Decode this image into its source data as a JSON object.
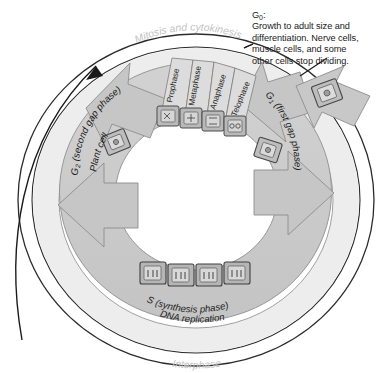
{
  "figure": {
    "type": "cell-cycle-diagram",
    "outer_band_label": "Interphase",
    "top_arc_label": "Mitosis and cytokinesis"
  },
  "callout": {
    "title_main": "G",
    "title_sub": "0",
    "title_colon": ":",
    "line1": "Growth to adult  size and",
    "line2": "differentiation. Nerve cells,",
    "line3": "muscle cells, and some",
    "line4": "other cells stop dividing."
  },
  "phases": {
    "g1": {
      "main": "G",
      "sub": "1",
      "rest": " (first gap phase)"
    },
    "g2": {
      "main": "G",
      "sub": "2",
      "rest": " (second gap phase)",
      "cell_note": "Plant cell"
    },
    "s": {
      "line1": "S (synthesis phase)",
      "line2": "DNA replication"
    }
  },
  "mitosis_stages": [
    {
      "label": "Prophase"
    },
    {
      "label": "Metaphase"
    },
    {
      "label": "Anaphase"
    },
    {
      "label": "Telophase"
    }
  ],
  "colors": {
    "ring_fill": "#c9c9c9",
    "band_fill": "#e8e8e8",
    "outline": "#2b2b2b",
    "wedge_fill": "#d5d5d5",
    "cell_fill": "#b3b3b3",
    "faint_text": "#c2c2c2",
    "body_text": "#1a1a1a"
  }
}
